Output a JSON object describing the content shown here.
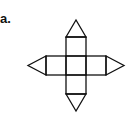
{
  "figure": {
    "label": "a.",
    "stroke_color": "#111111",
    "background": "#ffffff"
  }
}
